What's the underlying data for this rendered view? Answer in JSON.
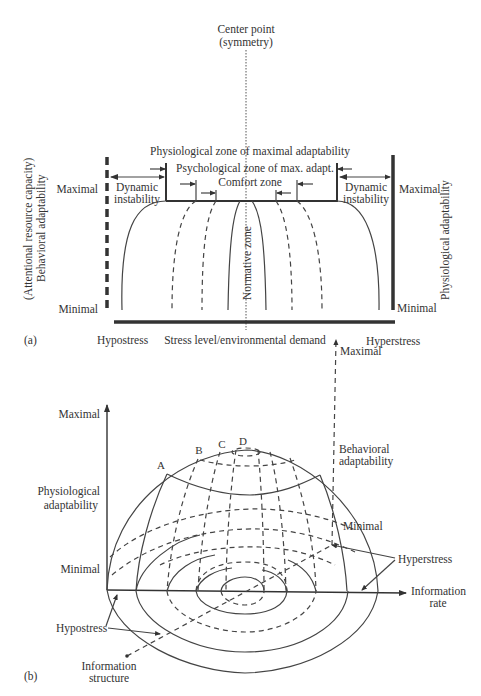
{
  "panel_a": {
    "label": "(a)",
    "center_point_line1": "Center point",
    "center_point_line2": "(symmetry)",
    "phys_zone": "Physiological zone of maximal adaptability",
    "psych_zone": "Psychological zone of max. adapt.",
    "comfort_zone": "Comfort zone",
    "normative_zone": "Normative zone",
    "dyn_left_line1": "Dynamic",
    "dyn_left_line2": "instability",
    "dyn_right_line1": "Dynamic",
    "dyn_right_line2": "instability",
    "left_max": "Maximal",
    "left_min": "Minimal",
    "right_max": "Maximal",
    "right_min": "Minimal",
    "left_axis_line1": "(Attentional resource capacity)",
    "left_axis_line2": "Behavioral adaptability",
    "right_axis": "Physiological adaptability",
    "x_left": "Hypostress",
    "x_center": "Stress level/environmental demand",
    "x_right": "Hyperstress"
  },
  "panel_b": {
    "label": "(b)",
    "y_max": "Maximal",
    "y_axis_line1": "Physiological",
    "y_axis_line2": "adaptability",
    "y_min": "Minimal",
    "beh_max": "Maximal",
    "beh_line1": "Behavioral",
    "beh_line2": "adaptability",
    "beh_min": "Minimal",
    "hyperstress": "Hyperstress",
    "hypostress": "Hypostress",
    "x_axis_line1": "Information",
    "x_axis_line2": "rate",
    "z_axis_line1": "Information",
    "z_axis_line2": "structure",
    "point_a": "A",
    "point_b": "B",
    "point_c": "C",
    "point_d": "D"
  }
}
